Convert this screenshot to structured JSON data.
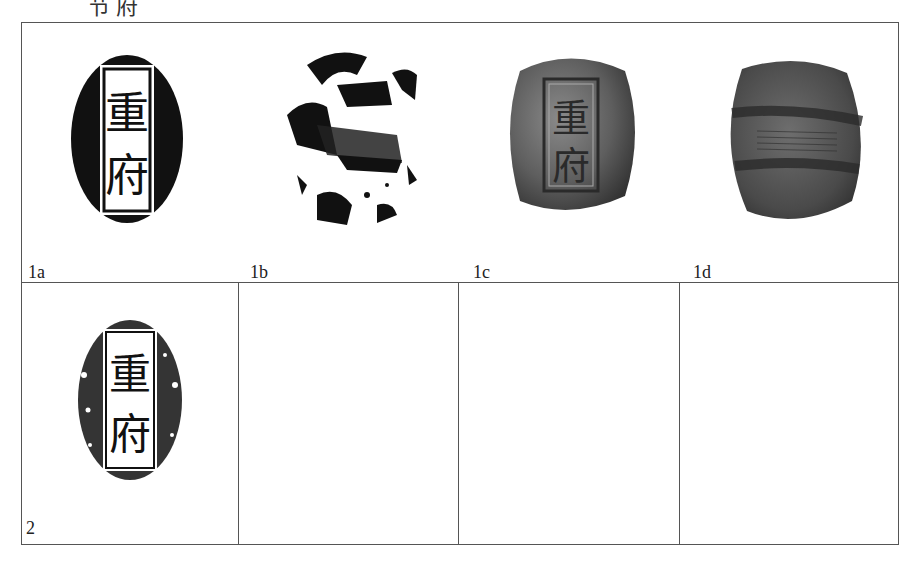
{
  "heading_fragment": "节府",
  "figure_table": {
    "row1": {
      "cells": [
        {
          "label": "1a",
          "description": "Rubbing of seal face with vertical inscription",
          "inscription": [
            "重",
            "府"
          ]
        },
        {
          "label": "1b",
          "description": "Rubbing of seal back with animal motif"
        },
        {
          "label": "1c",
          "description": "Photograph of clay seal face with inscription",
          "inscription": [
            "重",
            "府"
          ]
        },
        {
          "label": "1d",
          "description": "Photograph of clay seal back"
        }
      ]
    },
    "row2": {
      "cells": [
        {
          "label": "2",
          "description": "Rubbing of seal with vertical inscription",
          "inscription": [
            "重",
            "府"
          ]
        },
        {
          "label": ""
        },
        {
          "label": ""
        },
        {
          "label": ""
        }
      ]
    }
  },
  "colors": {
    "border": "#555555",
    "ink": "#111111",
    "clay_dark": "#3a3a3a",
    "clay_mid": "#5e5e5e"
  }
}
